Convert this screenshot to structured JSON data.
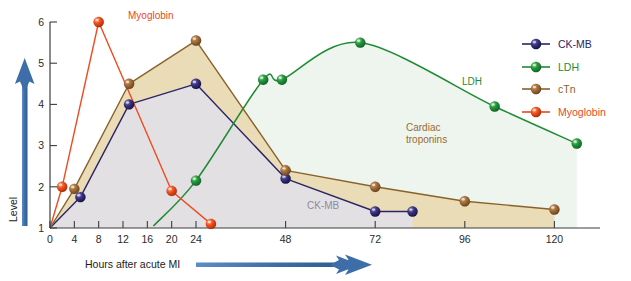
{
  "chart_data": {
    "type": "line",
    "title": "",
    "xlabel": "Hours after acute MI",
    "ylabel": "Level",
    "xticks": [
      0,
      4,
      8,
      12,
      16,
      20,
      24,
      48,
      72,
      96,
      120
    ],
    "yticks": [
      1,
      2,
      3,
      4,
      5,
      6
    ],
    "xlim": [
      0,
      128
    ],
    "ylim": [
      1,
      6
    ],
    "grid": false,
    "legend_position": "right",
    "series": [
      {
        "name": "CK-MB",
        "color": "#2b2566",
        "marker_color": "#3b3380",
        "points": [
          {
            "x": 0,
            "y": 1.0
          },
          {
            "x": 5,
            "y": 1.75
          },
          {
            "x": 13,
            "y": 4.0
          },
          {
            "x": 24,
            "y": 4.5
          },
          {
            "x": 48,
            "y": 2.2
          },
          {
            "x": 72,
            "y": 1.4
          },
          {
            "x": 82,
            "y": 1.4
          }
        ]
      },
      {
        "name": "LDH",
        "color": "#1f8b34",
        "marker_color": "#23993a",
        "points": [
          {
            "x": 17,
            "y": 1.05
          },
          {
            "x": 24,
            "y": 2.15
          },
          {
            "x": 42,
            "y": 4.6
          },
          {
            "x": 47,
            "y": 4.6
          },
          {
            "x": 68,
            "y": 5.5
          },
          {
            "x": 104,
            "y": 3.95
          },
          {
            "x": 126,
            "y": 3.05
          }
        ]
      },
      {
        "name": "cTn",
        "color": "#8a6129",
        "marker_color": "#a5703a",
        "points": [
          {
            "x": 0,
            "y": 1.0
          },
          {
            "x": 4,
            "y": 1.95
          },
          {
            "x": 13,
            "y": 4.5
          },
          {
            "x": 24,
            "y": 5.55
          },
          {
            "x": 48,
            "y": 2.4
          },
          {
            "x": 72,
            "y": 2.0
          },
          {
            "x": 96,
            "y": 1.65
          },
          {
            "x": 120,
            "y": 1.45
          }
        ]
      },
      {
        "name": "Myoglobin",
        "color": "#f04b1e",
        "marker_color": "#f4501f",
        "points": [
          {
            "x": 0,
            "y": 1.0
          },
          {
            "x": 2,
            "y": 2.0
          },
          {
            "x": 8,
            "y": 6.0
          },
          {
            "x": 20,
            "y": 1.9
          },
          {
            "x": 28,
            "y": 1.1
          }
        ]
      }
    ],
    "annotations": [
      {
        "text": "Myoglobin",
        "x": 128,
        "y": 19,
        "color": "#e8491d"
      },
      {
        "text": "LDH",
        "x": 462,
        "y": 85,
        "color": "#1f8b34"
      },
      {
        "text": "Cardiac",
        "x": 406,
        "y": 131,
        "color": "#9b6b2e"
      },
      {
        "text": "troponins",
        "x": 406,
        "y": 143,
        "color": "#9b6b2e"
      },
      {
        "text": "CK-MB",
        "x": 307,
        "y": 209,
        "color": "#8e8aa0"
      }
    ],
    "fills": [
      {
        "name": "ldh-area",
        "color": "#edf5ee"
      },
      {
        "name": "ctn-area",
        "color": "#e9dcb7"
      },
      {
        "name": "ckmb-area",
        "color": "#e3e0e4"
      }
    ]
  },
  "axes": {
    "y_axis_label": "Level",
    "x_axis_label": "Hours after acute MI",
    "arrow_color": "#3c6ca8",
    "arrow_color_dark": "#36608f"
  },
  "legend": {
    "items": [
      {
        "label": "CK-MB",
        "color": "#2b2566",
        "marker": "#3b3380"
      },
      {
        "label": "LDH",
        "color": "#1f8b34",
        "marker": "#23993a"
      },
      {
        "label": "cTn",
        "color": "#8a6129",
        "marker": "#a5703a"
      },
      {
        "label": "Myoglobin",
        "color": "#e8491d",
        "marker": "#f4501f"
      }
    ]
  }
}
